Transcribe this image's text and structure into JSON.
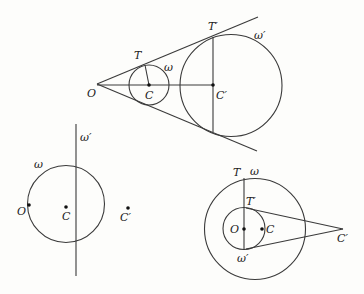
{
  "figures": {
    "top": {
      "labels": {
        "O": "O",
        "C": "C",
        "C_prime": "C′",
        "T": "T",
        "T_prime": "T′",
        "omega": "ω",
        "omega_prime": "ω′"
      }
    },
    "bottom_left": {
      "labels": {
        "O": "O",
        "C": "C",
        "C_prime": "C′",
        "omega": "ω",
        "omega_prime": "ω′"
      }
    },
    "bottom_right": {
      "labels": {
        "O": "O",
        "C": "C",
        "C_prime": "C′",
        "T": "T",
        "T_prime": "T′",
        "omega": "ω",
        "omega_prime": "ω′"
      }
    }
  }
}
